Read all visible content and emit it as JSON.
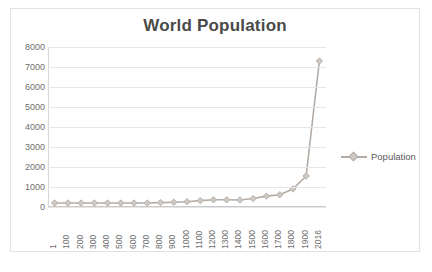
{
  "chart": {
    "title": "World Population",
    "border_color": "#e2e2e2",
    "gridline_color": "#e6e6e6",
    "series_color": "#b3aca6",
    "marker_fill": "#cfc9c4",
    "title_color": "#4a4a4a",
    "tick_color": "#6e6e6e"
  },
  "legend": {
    "position": "right",
    "entries": [
      {
        "label": "Population",
        "marker": "diamond-marker-icon",
        "color": "#b3aca6"
      }
    ]
  },
  "chart_data": {
    "type": "line",
    "title": "World Population",
    "xlabel": "",
    "ylabel": "",
    "ylim": [
      0,
      8000
    ],
    "ytick_step": 1000,
    "yticks": [
      0,
      1000,
      2000,
      3000,
      4000,
      5000,
      6000,
      7000,
      8000
    ],
    "grid": true,
    "legend_position": "right",
    "categories": [
      "1",
      "100",
      "200",
      "300",
      "400",
      "500",
      "600",
      "700",
      "800",
      "900",
      "1000",
      "1100",
      "1200",
      "1300",
      "1400",
      "1500",
      "1600",
      "1700",
      "1800",
      "1900",
      "2016"
    ],
    "series": [
      {
        "name": "Population",
        "marker": "diamond",
        "values": [
          200,
          200,
          200,
          200,
          200,
          200,
          200,
          200,
          220,
          240,
          265,
          320,
          360,
          360,
          350,
          425,
          545,
          610,
          900,
          1550,
          7300
        ]
      }
    ]
  }
}
